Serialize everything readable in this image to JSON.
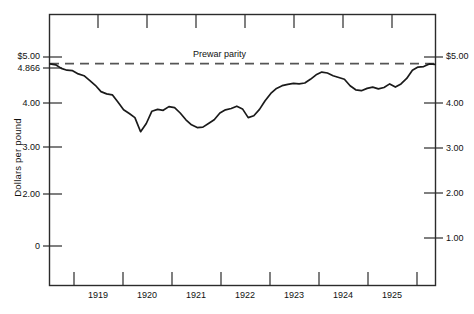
{
  "figure": {
    "ylabel": "Dollars per pound",
    "annotation": "Prewar parity"
  },
  "axes": {
    "left_ticks": [
      {
        "label": "$5.00",
        "y": 57
      },
      {
        "label": "4.866",
        "y": 68
      },
      {
        "label": "4.00",
        "y": 103
      },
      {
        "label": "3.00",
        "y": 147
      },
      {
        "label": "2.00",
        "y": 194
      },
      {
        "label": "0",
        "y": 246
      }
    ],
    "right_ticks": [
      {
        "label": "$5.00",
        "y": 57
      },
      {
        "label": "4.00",
        "y": 103
      },
      {
        "label": "3.00",
        "y": 148
      },
      {
        "label": "2.00",
        "y": 193
      },
      {
        "label": "1.00",
        "y": 238
      }
    ],
    "x_ticks": [
      {
        "label": "1919",
        "x": 98
      },
      {
        "label": "1920",
        "x": 147
      },
      {
        "label": "1921",
        "x": 196
      },
      {
        "label": "1922",
        "x": 245
      },
      {
        "label": "1923",
        "x": 294
      },
      {
        "label": "1924",
        "x": 343
      },
      {
        "label": "1925",
        "x": 392
      }
    ]
  },
  "chart_data": {
    "type": "line",
    "title": "",
    "xlabel": "",
    "ylabel": "Dollars per pound",
    "x": [
      "1918.5",
      "1918.6",
      "1918.7",
      "1918.8",
      "1918.9",
      "1919.0",
      "1919.1",
      "1919.2",
      "1919.3",
      "1919.4",
      "1919.5",
      "1919.6",
      "1919.7",
      "1919.8",
      "1919.9",
      "1920.0",
      "1920.1",
      "1920.2",
      "1920.3",
      "1920.4",
      "1920.5",
      "1920.6",
      "1920.7",
      "1920.8",
      "1920.9",
      "1921.0",
      "1921.1",
      "1921.2",
      "1921.3",
      "1921.4",
      "1921.5",
      "1921.6",
      "1921.7",
      "1921.8",
      "1921.9",
      "1922.0",
      "1922.1",
      "1922.2",
      "1922.3",
      "1922.4",
      "1922.5",
      "1922.6",
      "1922.7",
      "1922.8",
      "1922.9",
      "1923.0",
      "1923.1",
      "1923.2",
      "1923.3",
      "1923.4",
      "1923.5",
      "1923.6",
      "1923.7",
      "1923.8",
      "1923.9",
      "1924.0",
      "1924.1",
      "1924.2",
      "1924.3",
      "1924.4",
      "1924.5",
      "1924.6",
      "1924.7",
      "1924.8",
      "1924.9",
      "1925.0",
      "1925.2",
      "1925.4",
      "1925.6"
    ],
    "series": [
      {
        "name": "Dollar-sterling exchange rate",
        "values": [
          4.86,
          4.84,
          4.76,
          4.72,
          4.71,
          4.64,
          4.6,
          4.5,
          4.39,
          4.25,
          4.2,
          4.18,
          4.02,
          3.85,
          3.77,
          3.68,
          3.37,
          3.55,
          3.82,
          3.86,
          3.84,
          3.92,
          3.9,
          3.78,
          3.63,
          3.52,
          3.46,
          3.47,
          3.55,
          3.63,
          3.78,
          3.85,
          3.88,
          3.93,
          3.87,
          3.68,
          3.72,
          3.86,
          4.05,
          4.21,
          4.32,
          4.38,
          4.41,
          4.43,
          4.42,
          4.44,
          4.52,
          4.62,
          4.68,
          4.66,
          4.6,
          4.56,
          4.52,
          4.38,
          4.29,
          4.27,
          4.32,
          4.35,
          4.31,
          4.34,
          4.42,
          4.35,
          4.42,
          4.54,
          4.72,
          4.79,
          4.8,
          4.86,
          4.85
        ]
      }
    ],
    "reference_lines": [
      {
        "label": "Prewar parity",
        "value": 4.866,
        "style": "dashed"
      }
    ],
    "xlim": [
      "1918.5",
      "1925.6"
    ],
    "ylim": [
      0,
      5.4
    ],
    "grid": false,
    "legend": null,
    "left_axis_scale": "$0 to $5.00 (dollars per pound)",
    "right_axis_scale": "$1.00 to $5.00 (dollars per pound)"
  },
  "colors": {
    "line": "#1a1a1a",
    "frame": "#2b2b2b",
    "parity": "#555555",
    "background": "#ffffff"
  }
}
